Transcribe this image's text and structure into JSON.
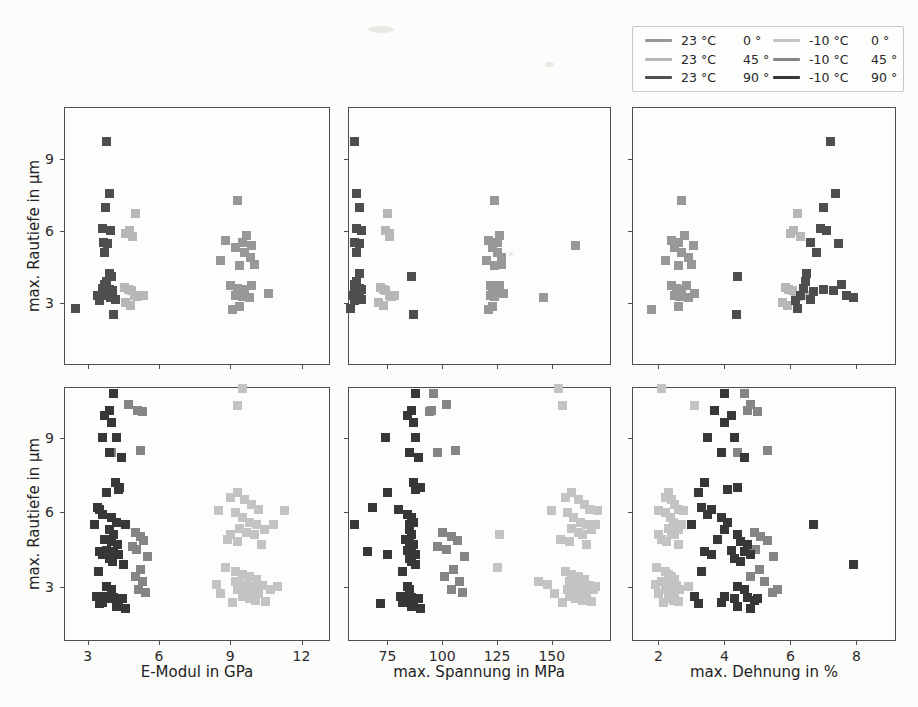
{
  "figure": {
    "background": "#fcfcfb"
  },
  "chart_data": {
    "type": "scatter",
    "title": "",
    "ylabel": "max. Rautiefe in µm",
    "yticks": [
      3,
      6,
      9
    ],
    "grid": false,
    "marker": "square",
    "marker_size_px": 9,
    "legend_position": "outside upper right",
    "point_format": [
      "E-Modul in GPa",
      "max. Spannung in MPa",
      "max. Dehnung in %",
      "max. Rautiefe in µm"
    ],
    "columns": [
      {
        "key": "E",
        "xlabel": "E-Modul in GPa",
        "xlim": [
          2.0,
          13.2
        ],
        "xticks": [
          3,
          6,
          9,
          12
        ]
      },
      {
        "key": "sigma",
        "xlabel": "max. Spannung in MPa",
        "xlim": [
          57,
          177
        ],
        "xticks": [
          75,
          100,
          125,
          150
        ]
      },
      {
        "key": "eps",
        "xlabel": "max. Dehnung in %",
        "xlim": [
          1.2,
          9.2
        ],
        "xticks": [
          2,
          4,
          6,
          8
        ]
      }
    ],
    "rows": [
      {
        "name": "23C",
        "ylim": [
          0.4,
          11.15
        ],
        "series": [
          "s23_0",
          "s23_45",
          "s23_90"
        ]
      },
      {
        "name": "m10C",
        "ylim": [
          0.8,
          11.05
        ],
        "series": [
          "sm10_0",
          "sm10_45",
          "sm10_90"
        ]
      }
    ],
    "legend_columns": [
      [
        "s23_0",
        "s23_45",
        "s23_90"
      ],
      [
        "sm10_0",
        "sm10_45",
        "sm10_90"
      ]
    ],
    "series": {
      "s23_0": {
        "temp": "23 °C",
        "angle": "0 °",
        "color": "#989898",
        "points": [
          [
            9.3,
            124,
            2.7,
            7.25
          ],
          [
            8.8,
            121,
            2.4,
            5.6
          ],
          [
            9.5,
            125,
            2.6,
            5.5
          ],
          [
            9.7,
            126,
            2.8,
            5.8
          ],
          [
            9.2,
            123,
            2.5,
            5.3
          ],
          [
            9.6,
            125,
            2.7,
            5.1
          ],
          [
            9.85,
            127,
            2.9,
            4.9
          ],
          [
            8.6,
            120,
            2.2,
            4.75
          ],
          [
            9.4,
            124,
            2.6,
            4.55
          ],
          [
            10.0,
            127,
            3.0,
            4.6
          ],
          [
            9.0,
            122,
            2.4,
            3.7
          ],
          [
            9.3,
            123,
            2.55,
            3.6
          ],
          [
            9.6,
            125,
            2.7,
            3.55
          ],
          [
            9.9,
            126,
            2.85,
            3.7
          ],
          [
            9.2,
            122,
            2.5,
            3.3
          ],
          [
            9.5,
            124,
            2.65,
            3.25
          ],
          [
            10.6,
            128,
            3.1,
            3.4
          ],
          [
            9.8,
            146,
            2.9,
            3.2
          ],
          [
            9.9,
            161,
            3.05,
            5.4
          ],
          [
            9.4,
            123,
            2.6,
            2.85
          ],
          [
            9.1,
            121,
            1.8,
            2.7
          ]
        ]
      },
      "s23_45": {
        "temp": "23 °C",
        "angle": "45 °",
        "color": "#b7b7b7",
        "points": [
          [
            5.0,
            75,
            6.2,
            6.7
          ],
          [
            4.75,
            74,
            6.1,
            6.0
          ],
          [
            4.6,
            76,
            6.0,
            5.9
          ],
          [
            4.9,
            76,
            6.3,
            5.75
          ],
          [
            4.55,
            72,
            5.85,
            3.65
          ],
          [
            4.7,
            73,
            5.95,
            3.55
          ],
          [
            4.85,
            74,
            6.05,
            3.5
          ],
          [
            4.95,
            76,
            6.15,
            3.3
          ],
          [
            5.1,
            77,
            6.25,
            3.25
          ],
          [
            5.35,
            78,
            6.45,
            3.3
          ],
          [
            4.6,
            71,
            5.75,
            3.0
          ],
          [
            4.8,
            73,
            5.9,
            2.9
          ]
        ]
      },
      "s23_90": {
        "temp": "23 °C",
        "angle": "90 °",
        "color": "#4e4e4e",
        "points": [
          [
            3.8,
            60,
            7.2,
            9.7
          ],
          [
            3.9,
            61,
            7.35,
            7.55
          ],
          [
            3.75,
            62,
            7.0,
            6.95
          ],
          [
            3.6,
            61,
            6.9,
            6.1
          ],
          [
            3.95,
            63,
            7.1,
            6.0
          ],
          [
            3.65,
            60,
            6.6,
            5.5
          ],
          [
            3.85,
            62,
            7.45,
            5.45
          ],
          [
            3.7,
            61,
            6.8,
            5.1
          ],
          [
            3.9,
            62,
            6.5,
            4.2
          ],
          [
            3.8,
            61,
            6.45,
            3.9
          ],
          [
            3.7,
            60,
            7.55,
            3.75
          ],
          [
            3.6,
            62,
            6.4,
            3.6
          ],
          [
            3.9,
            63,
            7.0,
            3.55
          ],
          [
            4.05,
            61,
            7.3,
            3.5
          ],
          [
            3.8,
            60,
            6.7,
            3.45
          ],
          [
            3.7,
            62,
            7.7,
            3.3
          ],
          [
            3.95,
            61,
            7.9,
            3.2
          ],
          [
            4.15,
            63,
            6.6,
            3.15
          ],
          [
            3.4,
            59,
            6.3,
            3.3
          ],
          [
            2.5,
            58,
            6.2,
            2.75
          ],
          [
            4.0,
            86,
            4.4,
            4.1
          ],
          [
            4.1,
            87,
            4.35,
            2.5
          ],
          [
            3.5,
            60,
            6.15,
            3.1
          ]
        ]
      },
      "sm10_0": {
        "temp": "-10 °C",
        "angle": "0 °",
        "color": "#c3c3c3",
        "points": [
          [
            9.5,
            153,
            2.1,
            11.0
          ],
          [
            9.3,
            155,
            3.1,
            10.3
          ],
          [
            8.5,
            150,
            2.0,
            6.05
          ],
          [
            9.0,
            156,
            2.2,
            6.6
          ],
          [
            9.3,
            159,
            2.3,
            6.8
          ],
          [
            9.6,
            162,
            2.4,
            6.5
          ],
          [
            9.9,
            165,
            2.5,
            6.3
          ],
          [
            10.2,
            167,
            2.6,
            6.1
          ],
          [
            9.2,
            157,
            2.2,
            6.0
          ],
          [
            9.5,
            160,
            2.35,
            5.8
          ],
          [
            9.8,
            163,
            2.45,
            5.6
          ],
          [
            10.1,
            166,
            2.55,
            5.5
          ],
          [
            10.45,
            168,
            2.6,
            5.3
          ],
          [
            9.4,
            159,
            2.3,
            5.35
          ],
          [
            9.7,
            162,
            2.4,
            5.2
          ],
          [
            10.0,
            164,
            2.5,
            5.1
          ],
          [
            10.8,
            170,
            2.7,
            5.5
          ],
          [
            11.3,
            171,
            2.75,
            6.05
          ],
          [
            8.9,
            154,
            2.1,
            4.9
          ],
          [
            9.3,
            158,
            2.25,
            4.8
          ],
          [
            10.3,
            166,
            2.6,
            4.7
          ],
          [
            9.0,
            126,
            2.0,
            5.1
          ],
          [
            8.8,
            125,
            1.95,
            3.75
          ],
          [
            9.2,
            144,
            2.1,
            3.2
          ],
          [
            8.4,
            148,
            1.9,
            3.1
          ],
          [
            9.2,
            156,
            2.2,
            3.6
          ],
          [
            9.5,
            159,
            2.3,
            3.5
          ],
          [
            9.8,
            162,
            2.4,
            3.4
          ],
          [
            10.1,
            165,
            2.5,
            3.3
          ],
          [
            9.4,
            158,
            2.25,
            3.2
          ],
          [
            9.7,
            161,
            2.35,
            3.1
          ],
          [
            10.0,
            164,
            2.45,
            3.0
          ],
          [
            10.35,
            167,
            2.55,
            3.05
          ],
          [
            9.3,
            157,
            2.2,
            2.9
          ],
          [
            9.6,
            160,
            2.3,
            2.8
          ],
          [
            9.9,
            163,
            2.4,
            2.75
          ],
          [
            10.2,
            166,
            2.5,
            2.7
          ],
          [
            10.7,
            169,
            2.65,
            2.9
          ],
          [
            9.5,
            158,
            2.3,
            2.6
          ],
          [
            9.8,
            161,
            2.4,
            2.5
          ],
          [
            10.05,
            164,
            2.45,
            2.45
          ],
          [
            8.6,
            151,
            2.0,
            2.7
          ],
          [
            9.1,
            155,
            2.15,
            2.35
          ],
          [
            10.5,
            168,
            2.6,
            2.4
          ],
          [
            11.0,
            170,
            2.9,
            3.0
          ]
        ]
      },
      "sm10_45": {
        "temp": "-10 °C",
        "angle": "45 °",
        "color": "#858585",
        "points": [
          [
            4.1,
            96,
            4.6,
            10.8
          ],
          [
            4.7,
            102,
            4.8,
            10.35
          ],
          [
            5.1,
            95,
            4.7,
            10.1
          ],
          [
            5.3,
            94,
            5.0,
            10.05
          ],
          [
            4.0,
            98,
            4.4,
            8.4
          ],
          [
            5.2,
            106,
            5.3,
            8.5
          ],
          [
            5.0,
            100,
            4.9,
            5.2
          ],
          [
            5.2,
            104,
            5.1,
            5.0
          ],
          [
            5.35,
            107,
            5.3,
            4.85
          ],
          [
            4.9,
            98,
            4.7,
            4.6
          ],
          [
            5.05,
            102,
            4.95,
            4.5
          ],
          [
            5.5,
            110,
            5.5,
            4.2
          ],
          [
            5.2,
            105,
            5.05,
            3.7
          ],
          [
            5.0,
            101,
            4.8,
            3.4
          ],
          [
            5.3,
            108,
            5.2,
            3.2
          ],
          [
            5.15,
            104,
            5.6,
            2.9
          ],
          [
            5.45,
            109,
            5.45,
            2.75
          ]
        ]
      },
      "sm10_90": {
        "temp": "-10 °C",
        "angle": "90 °",
        "color": "#373737",
        "points": [
          [
            4.1,
            88,
            4.0,
            10.8
          ],
          [
            3.9,
            86,
            3.7,
            10.1
          ],
          [
            3.7,
            84,
            4.2,
            9.9
          ],
          [
            4.0,
            87,
            4.0,
            9.6
          ],
          [
            3.6,
            74,
            3.5,
            9.0
          ],
          [
            4.2,
            88,
            4.3,
            9.0
          ],
          [
            3.9,
            85,
            3.9,
            8.4
          ],
          [
            4.4,
            89,
            4.6,
            8.2
          ],
          [
            4.15,
            87,
            3.4,
            7.2
          ],
          [
            4.35,
            90,
            4.4,
            7.0
          ],
          [
            3.8,
            75,
            3.2,
            6.8
          ],
          [
            4.3,
            88,
            4.1,
            6.9
          ],
          [
            3.4,
            68,
            3.3,
            6.2
          ],
          [
            3.5,
            80,
            3.6,
            6.1
          ],
          [
            3.6,
            84,
            3.5,
            5.9
          ],
          [
            4.0,
            86,
            3.9,
            5.8
          ],
          [
            4.2,
            87,
            4.1,
            5.6
          ],
          [
            3.3,
            60,
            3.0,
            5.5
          ],
          [
            3.9,
            85,
            4.0,
            5.3
          ],
          [
            4.1,
            86,
            4.4,
            5.1
          ],
          [
            4.6,
            85,
            6.7,
            5.5
          ],
          [
            3.7,
            83,
            3.8,
            4.9
          ],
          [
            4.0,
            85,
            4.5,
            4.8
          ],
          [
            4.25,
            87,
            4.7,
            4.7
          ],
          [
            3.5,
            66,
            3.4,
            4.4
          ],
          [
            3.8,
            84,
            4.2,
            4.45
          ],
          [
            4.1,
            86,
            4.6,
            4.4
          ],
          [
            4.3,
            88,
            4.8,
            4.3
          ],
          [
            3.6,
            75,
            3.6,
            4.3
          ],
          [
            3.9,
            85,
            4.3,
            4.15
          ],
          [
            4.05,
            86,
            4.5,
            4.0
          ],
          [
            3.45,
            82,
            3.3,
            3.6
          ],
          [
            4.5,
            88,
            7.9,
            3.9
          ],
          [
            3.8,
            84,
            4.4,
            3.0
          ],
          [
            4.0,
            85,
            4.6,
            2.9
          ],
          [
            3.5,
            72,
            3.2,
            2.3
          ],
          [
            3.7,
            83,
            4.0,
            2.6
          ],
          [
            3.9,
            84,
            4.3,
            2.5
          ],
          [
            4.1,
            86,
            4.7,
            2.55
          ],
          [
            4.3,
            87,
            4.9,
            2.45
          ],
          [
            3.6,
            82,
            3.9,
            2.35
          ],
          [
            4.2,
            86,
            4.4,
            2.2
          ],
          [
            4.45,
            89,
            5.0,
            2.5
          ],
          [
            3.35,
            81,
            3.1,
            2.6
          ],
          [
            4.6,
            90,
            4.8,
            2.1
          ]
        ]
      }
    }
  }
}
